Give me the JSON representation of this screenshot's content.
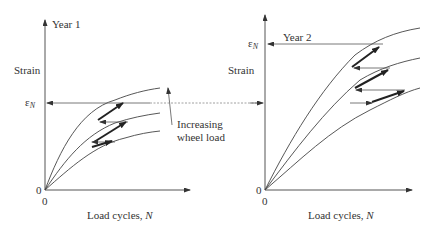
{
  "figure": {
    "left_panel": {
      "title": "Year 1",
      "y_label": "Strain",
      "x_label_text": "Load cycles, ",
      "x_label_var": "N",
      "y_tick_eps": "ε",
      "y_tick_eps_sub": "N",
      "origin_y": "0",
      "origin_x": "0",
      "annotation_line1": "Increasing",
      "annotation_line2": "wheel load"
    },
    "right_panel": {
      "title": "Year 2",
      "y_label": "Strain",
      "x_label_text": "Load cycles, ",
      "x_label_var": "N",
      "y_tick_eps": "ε",
      "y_tick_eps_sub": "N",
      "origin_y": "0",
      "origin_x": "0"
    },
    "colors": {
      "line": "#444444",
      "thick_arrow": "#222222",
      "dashed": "#888888",
      "text": "#333333"
    }
  }
}
